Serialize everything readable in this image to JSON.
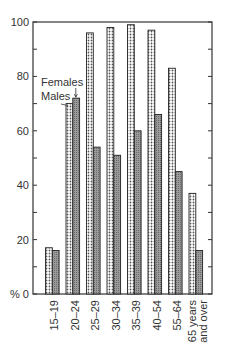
{
  "chart_data": {
    "type": "bar",
    "title": "",
    "xlabel": "",
    "ylabel": "%",
    "ylim": [
      0,
      100
    ],
    "yticks": [
      0,
      20,
      40,
      60,
      80,
      100
    ],
    "grid": false,
    "categories": [
      "15–19",
      "20–24",
      "25–29",
      "30–34",
      "35–39",
      "40–54",
      "55–64",
      "65 years and over"
    ],
    "series": [
      {
        "name": "Females",
        "pattern": "dotted",
        "values": [
          17,
          70,
          96,
          98,
          99,
          97,
          83,
          37
        ]
      },
      {
        "name": "Males",
        "pattern": "grey-hatched",
        "values": [
          16,
          72,
          54,
          51,
          60,
          66,
          45,
          16
        ]
      }
    ],
    "annotations": [
      {
        "text": "Females",
        "points_to": "20–24 Females bar"
      },
      {
        "text": "Males",
        "points_to": "20–24 Males bar"
      }
    ],
    "legend_position": "inline annotation near 20–24 group"
  }
}
